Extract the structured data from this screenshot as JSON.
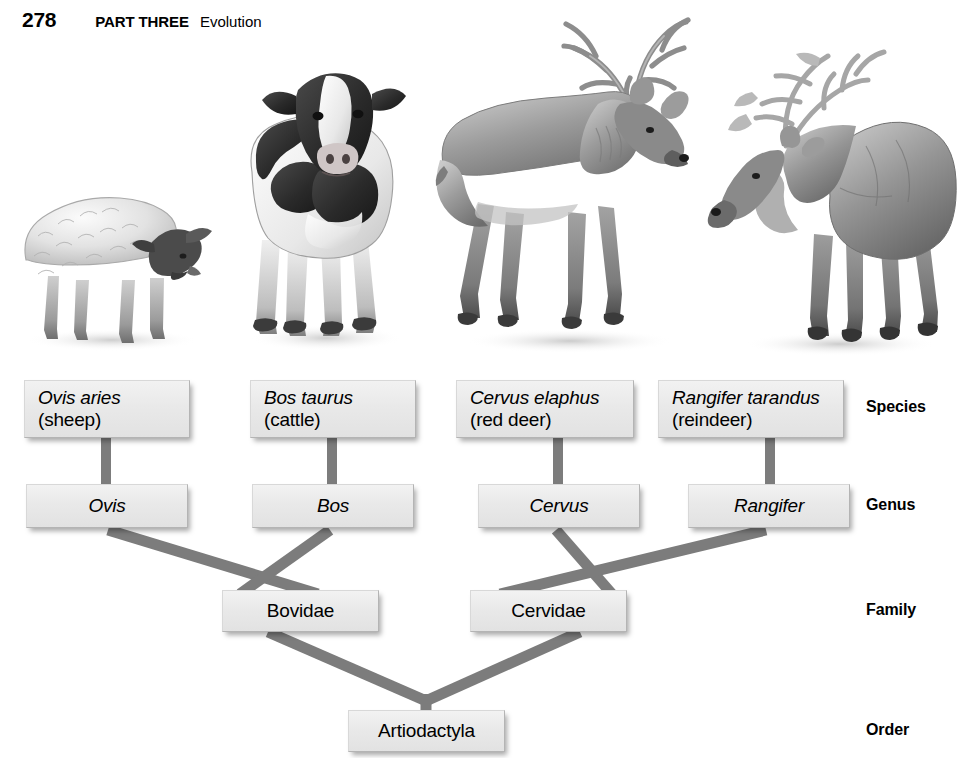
{
  "running_head": {
    "page_number": "278",
    "part": "PART THREE",
    "section_title": "Evolution"
  },
  "figure": {
    "kind": "taxonomic-hierarchy-diagram",
    "connector_color": "#7c7c7c",
    "box_fill": "#ebebeb",
    "box_border": "#b4b4b4",
    "illustration_style": "grayscale-pencil-rendering"
  },
  "illustrations": [
    {
      "name": "sheep-illustration",
      "caption_species": "Ovis aries",
      "facing": "right"
    },
    {
      "name": "cow-illustration",
      "caption_species": "Bos taurus",
      "facing": "front"
    },
    {
      "name": "red-deer-illustration",
      "caption_species": "Cervus elaphus",
      "facing": "right"
    },
    {
      "name": "reindeer-illustration",
      "caption_species": "Rangifer tarandus",
      "facing": "left"
    }
  ],
  "ranks": [
    {
      "id": "species",
      "label": "Species"
    },
    {
      "id": "genus",
      "label": "Genus"
    },
    {
      "id": "family",
      "label": "Family"
    },
    {
      "id": "order",
      "label": "Order"
    }
  ],
  "species": [
    {
      "scientific": "Ovis aries",
      "common": "(sheep)"
    },
    {
      "scientific": "Bos taurus",
      "common": "(cattle)"
    },
    {
      "scientific": "Cervus elaphus",
      "common": "(red deer)"
    },
    {
      "scientific": "Rangifer tarandus",
      "common": "(reindeer)"
    }
  ],
  "genera": [
    {
      "name": "Ovis"
    },
    {
      "name": "Bos"
    },
    {
      "name": "Cervus"
    },
    {
      "name": "Rangifer"
    }
  ],
  "families": [
    {
      "name": "Bovidae"
    },
    {
      "name": "Cervidae"
    }
  ],
  "order": {
    "name": "Artiodactyla"
  }
}
